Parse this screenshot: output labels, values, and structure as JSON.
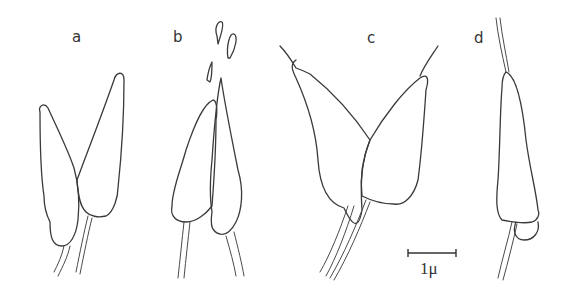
{
  "figure": {
    "panels": [
      {
        "id": "a",
        "label": "a",
        "description": "two elongated cells joined at stalks"
      },
      {
        "id": "b",
        "label": "b",
        "description": "two cells with detached small fragments above"
      },
      {
        "id": "c",
        "label": "c",
        "description": "two cells in V shape with tipped apices"
      },
      {
        "id": "d",
        "label": "d",
        "description": "single elongated cell with apical filament and basal bulge"
      }
    ],
    "scale_bar": {
      "label": "1μ",
      "length_px": 48
    },
    "colors": {
      "ink": "#3a3a3a",
      "background": "#ffffff"
    }
  }
}
